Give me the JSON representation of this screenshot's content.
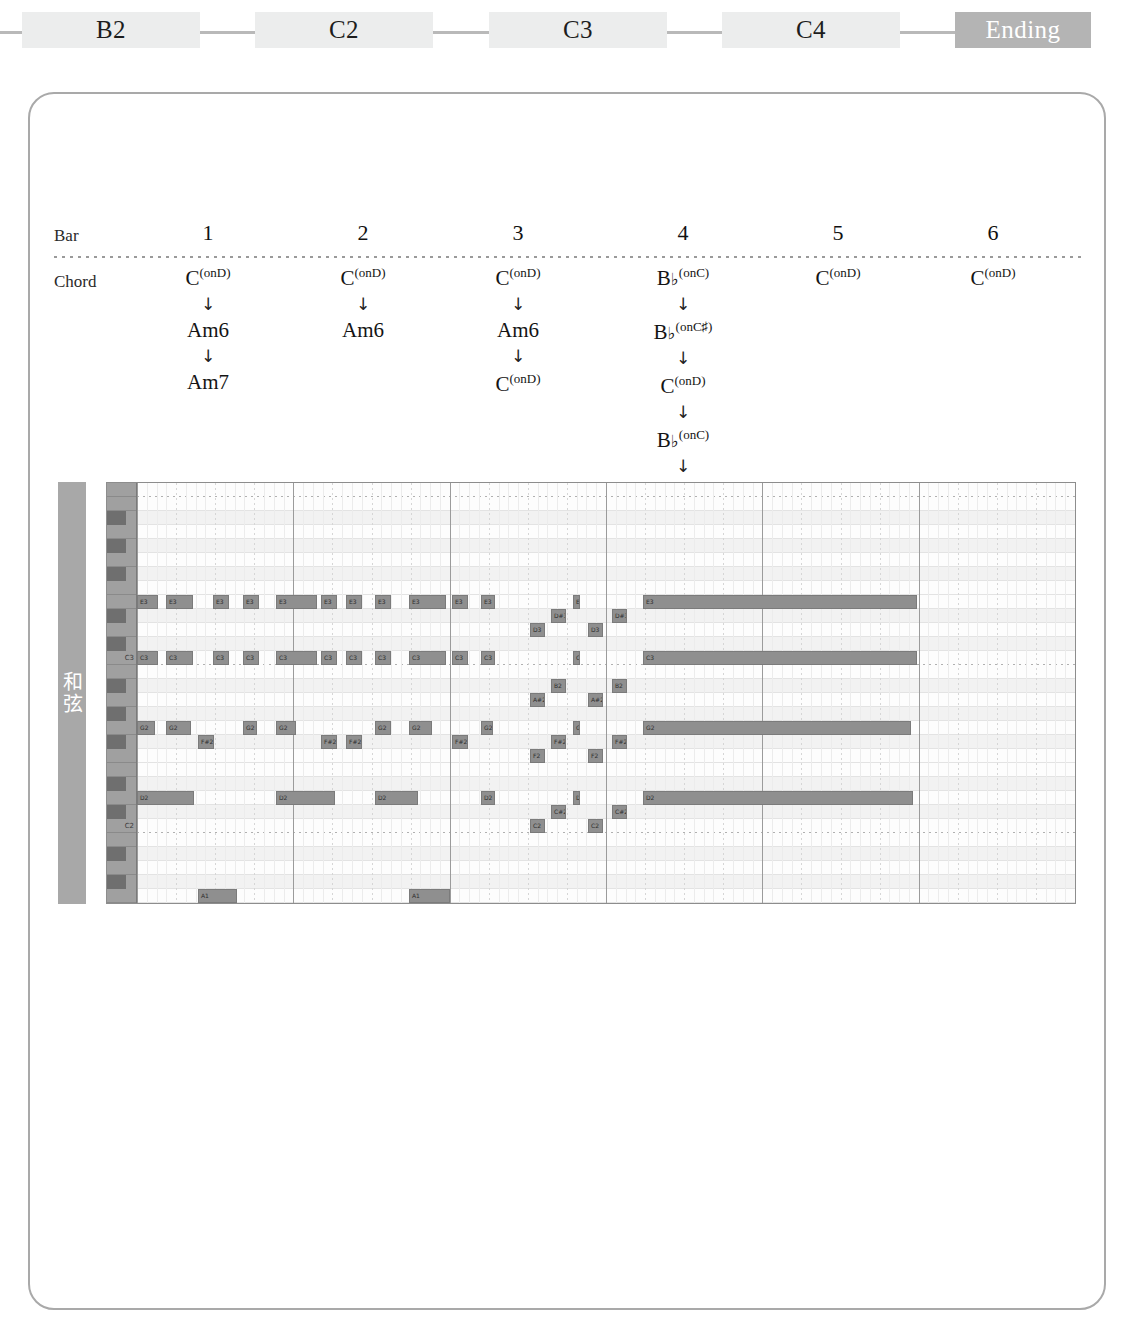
{
  "section_nav": {
    "tabs": [
      {
        "label": "B2",
        "active": false,
        "x": 22,
        "width": 178
      },
      {
        "label": "C2",
        "active": false,
        "x": 255,
        "width": 178
      },
      {
        "label": "C3",
        "active": false,
        "x": 489,
        "width": 178
      },
      {
        "label": "C4",
        "active": false,
        "x": 722,
        "width": 178
      },
      {
        "label": "Ending",
        "active": true,
        "x": 955,
        "width": 136
      }
    ],
    "connector_color": "#b9b9b9",
    "tab_color": "#eceded",
    "active_tab_color": "#b4b4b4"
  },
  "chord_table": {
    "row_labels": {
      "bar": "Bar",
      "chord": "Chord"
    },
    "bars": [
      "1",
      "2",
      "3",
      "4",
      "5",
      "6"
    ],
    "arrow_glyph": "↓",
    "columns": [
      {
        "bar": "1",
        "chords": [
          {
            "root": "C",
            "sup": "(onD)",
            "flat": false
          },
          {
            "root": "Am6",
            "sup": "",
            "flat": false
          },
          {
            "root": "Am7",
            "sup": "",
            "flat": false
          }
        ]
      },
      {
        "bar": "2",
        "chords": [
          {
            "root": "C",
            "sup": "(onD)",
            "flat": false
          },
          {
            "root": "Am6",
            "sup": "",
            "flat": false
          }
        ]
      },
      {
        "bar": "3",
        "chords": [
          {
            "root": "C",
            "sup": "(onD)",
            "flat": false
          },
          {
            "root": "Am6",
            "sup": "",
            "flat": false
          },
          {
            "root": "C",
            "sup": "(onD)",
            "flat": false
          }
        ]
      },
      {
        "bar": "4",
        "chords": [
          {
            "root": "B",
            "sup": "(onC)",
            "flat": true
          },
          {
            "root": "B",
            "sup": "(onC♯)",
            "flat": true
          },
          {
            "root": "C",
            "sup": "(onD)",
            "flat": false
          },
          {
            "root": "B",
            "sup": "(onC)",
            "flat": true
          },
          {
            "root": "B",
            "sup": "(onC♯)",
            "flat": true
          }
        ]
      },
      {
        "bar": "5",
        "chords": [
          {
            "root": "C",
            "sup": "(onD)",
            "flat": false
          }
        ]
      },
      {
        "bar": "6",
        "chords": [
          {
            "root": "C",
            "sup": "(onD)",
            "flat": false
          }
        ]
      }
    ]
  },
  "piano_roll": {
    "track_name": "和弦",
    "key_labels": [
      {
        "name": "C3",
        "row": 12
      },
      {
        "name": "C2",
        "row": 24
      }
    ],
    "bars": 6,
    "beats_per_bar": 4,
    "pitch_top": "B3",
    "pitch_bottom": "C1",
    "note_color": "#8f8f8f",
    "grid_bg": "#fdfdfd",
    "notes": [
      {
        "label": "E3",
        "row": 8,
        "start": 0.0,
        "len": 0.55
      },
      {
        "label": "C3",
        "row": 12,
        "start": 0.0,
        "len": 0.55
      },
      {
        "label": "G2",
        "row": 17,
        "start": 0.0,
        "len": 0.45
      },
      {
        "label": "D2",
        "row": 22,
        "start": 0.0,
        "len": 1.45
      },
      {
        "label": "E3",
        "row": 8,
        "start": 0.75,
        "len": 0.7
      },
      {
        "label": "C3",
        "row": 12,
        "start": 0.75,
        "len": 0.7
      },
      {
        "label": "G2",
        "row": 17,
        "start": 0.75,
        "len": 0.65
      },
      {
        "label": "F#2",
        "row": 18,
        "start": 1.55,
        "len": 0.4
      },
      {
        "label": "A1",
        "row": 29,
        "start": 1.55,
        "len": 1.0
      },
      {
        "label": "E3",
        "row": 8,
        "start": 1.95,
        "len": 0.4
      },
      {
        "label": "C3",
        "row": 12,
        "start": 1.95,
        "len": 0.4
      },
      {
        "label": "E3",
        "row": 8,
        "start": 2.7,
        "len": 0.4
      },
      {
        "label": "C3",
        "row": 12,
        "start": 2.7,
        "len": 0.4
      },
      {
        "label": "G2",
        "row": 17,
        "start": 2.7,
        "len": 0.35
      },
      {
        "label": "E3",
        "row": 8,
        "start": 3.55,
        "len": 1.05
      },
      {
        "label": "C3",
        "row": 12,
        "start": 3.55,
        "len": 1.05
      },
      {
        "label": "G2",
        "row": 17,
        "start": 3.55,
        "len": 0.5
      },
      {
        "label": "D2",
        "row": 22,
        "start": 3.55,
        "len": 1.5
      },
      {
        "label": "E3",
        "row": 8,
        "start": 4.7,
        "len": 0.4
      },
      {
        "label": "C3",
        "row": 12,
        "start": 4.7,
        "len": 0.4
      },
      {
        "label": "F#2",
        "row": 18,
        "start": 4.7,
        "len": 0.4
      },
      {
        "label": "E3",
        "row": 8,
        "start": 5.35,
        "len": 0.4
      },
      {
        "label": "C3",
        "row": 12,
        "start": 5.35,
        "len": 0.4
      },
      {
        "label": "F#2",
        "row": 18,
        "start": 5.35,
        "len": 0.4
      },
      {
        "label": "E3",
        "row": 8,
        "start": 6.1,
        "len": 0.4
      },
      {
        "label": "C3",
        "row": 12,
        "start": 6.1,
        "len": 0.4
      },
      {
        "label": "G2",
        "row": 17,
        "start": 6.1,
        "len": 0.4
      },
      {
        "label": "D2",
        "row": 22,
        "start": 6.1,
        "len": 1.1
      },
      {
        "label": "A1",
        "row": 29,
        "start": 6.95,
        "len": 1.05
      },
      {
        "label": "E3",
        "row": 8,
        "start": 6.95,
        "len": 0.95
      },
      {
        "label": "C3",
        "row": 12,
        "start": 6.95,
        "len": 0.95
      },
      {
        "label": "G2",
        "row": 17,
        "start": 6.95,
        "len": 0.6
      },
      {
        "label": "E3",
        "row": 8,
        "start": 8.05,
        "len": 0.4
      },
      {
        "label": "C3",
        "row": 12,
        "start": 8.05,
        "len": 0.4
      },
      {
        "label": "F#2",
        "row": 18,
        "start": 8.05,
        "len": 0.4
      },
      {
        "label": "E3",
        "row": 8,
        "start": 8.8,
        "len": 0.35
      },
      {
        "label": "C3",
        "row": 12,
        "start": 8.8,
        "len": 0.35
      },
      {
        "label": "G2",
        "row": 17,
        "start": 8.8,
        "len": 0.3
      },
      {
        "label": "D2",
        "row": 22,
        "start": 8.8,
        "len": 0.35
      },
      {
        "label": "D3",
        "row": 10,
        "start": 10.05,
        "len": 0.38
      },
      {
        "label": "A#2",
        "row": 15,
        "start": 10.05,
        "len": 0.38
      },
      {
        "label": "F2",
        "row": 19,
        "start": 10.05,
        "len": 0.38
      },
      {
        "label": "C2",
        "row": 24,
        "start": 10.05,
        "len": 0.38
      },
      {
        "label": "D#3",
        "row": 9,
        "start": 10.6,
        "len": 0.38
      },
      {
        "label": "B2",
        "row": 14,
        "start": 10.6,
        "len": 0.38
      },
      {
        "label": "F#2",
        "row": 18,
        "start": 10.6,
        "len": 0.38
      },
      {
        "label": "C#2",
        "row": 23,
        "start": 10.6,
        "len": 0.38
      },
      {
        "label": "E3",
        "row": 8,
        "start": 11.15,
        "len": 0.18
      },
      {
        "label": "C3",
        "row": 12,
        "start": 11.15,
        "len": 0.18
      },
      {
        "label": "G2",
        "row": 17,
        "start": 11.15,
        "len": 0.18
      },
      {
        "label": "D2",
        "row": 22,
        "start": 11.15,
        "len": 0.18
      },
      {
        "label": "D3",
        "row": 10,
        "start": 11.55,
        "len": 0.38
      },
      {
        "label": "A#2",
        "row": 15,
        "start": 11.55,
        "len": 0.38
      },
      {
        "label": "F2",
        "row": 19,
        "start": 11.55,
        "len": 0.38
      },
      {
        "label": "C2",
        "row": 24,
        "start": 11.55,
        "len": 0.38
      },
      {
        "label": "D#3",
        "row": 9,
        "start": 12.15,
        "len": 0.38
      },
      {
        "label": "B2",
        "row": 14,
        "start": 12.15,
        "len": 0.38
      },
      {
        "label": "F#2",
        "row": 18,
        "start": 12.15,
        "len": 0.38
      },
      {
        "label": "C#2",
        "row": 23,
        "start": 12.15,
        "len": 0.38
      },
      {
        "label": "E3",
        "row": 8,
        "start": 12.95,
        "len": 7.0
      },
      {
        "label": "C3",
        "row": 12,
        "start": 12.95,
        "len": 7.0
      },
      {
        "label": "G2",
        "row": 17,
        "start": 12.95,
        "len": 6.85
      },
      {
        "label": "D2",
        "row": 22,
        "start": 12.95,
        "len": 6.9
      }
    ]
  }
}
